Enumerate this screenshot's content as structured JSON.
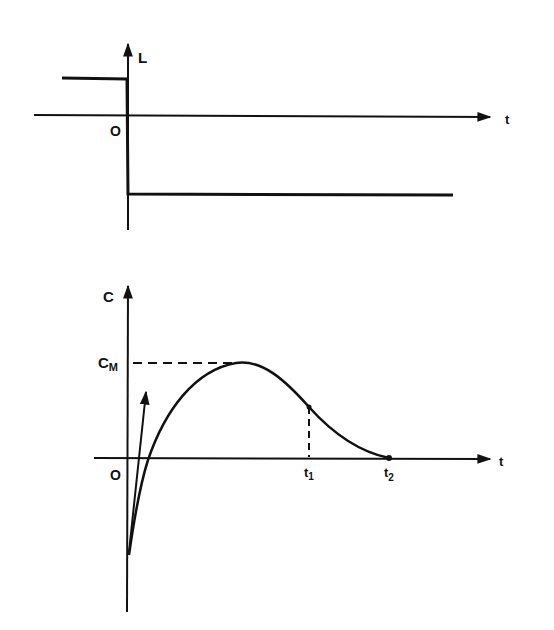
{
  "top_plot": {
    "y_axis_label": "L",
    "x_axis_label": "t",
    "origin_label": "O",
    "description": "Step change of L at t=0: positive constant before 0, negative constant after 0"
  },
  "bottom_plot": {
    "y_axis_label": "C",
    "x_axis_label": "t",
    "origin_label": "O",
    "max_label_main": "C",
    "max_label_sub": "M",
    "t1_main": "t",
    "t1_sub": "1",
    "t2_main": "t",
    "t2_sub": "2",
    "description": "Response C rises from negative value, crosses zero, peaks at C_M, inflection at t1, returns to zero at t2"
  },
  "colors": {
    "ink": "#111111",
    "background": "#ffffff"
  }
}
